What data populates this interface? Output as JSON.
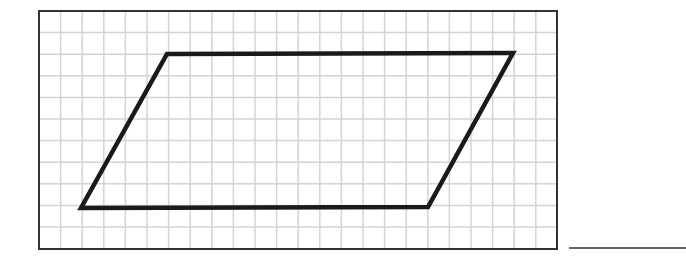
{
  "figure": {
    "grid": {
      "left": 39,
      "top": 11,
      "right": 557,
      "bottom": 249,
      "cell": 21.6,
      "line_color": "#d4d4d4",
      "border_color": "#333333"
    },
    "shape": {
      "type": "parallelogram",
      "vertices": [
        [
          167,
          54
        ],
        [
          513,
          53
        ],
        [
          428,
          207
        ],
        [
          81,
          208
        ]
      ],
      "stroke_color": "#1a1a1a",
      "stroke_width": 4.5
    },
    "answer_line": {
      "x1": 569,
      "x2": 686,
      "y": 248,
      "color": "#333333",
      "value": ""
    }
  }
}
